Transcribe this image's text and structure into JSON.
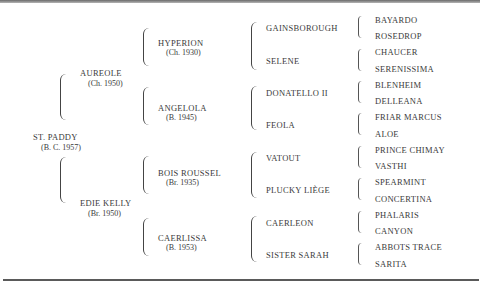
{
  "pedigree": {
    "subject": {
      "name": "ST. PADDY",
      "detail": "(B. C. 1957)"
    },
    "sire": {
      "name": "AUREOLE",
      "detail": "(Ch. 1950)"
    },
    "dam": {
      "name": "EDIE KELLY",
      "detail": "(Br. 1950)"
    },
    "gen2": [
      {
        "name": "HYPERION",
        "detail": "(Ch. 1930)"
      },
      {
        "name": "ANGELOLA",
        "detail": "(B. 1945)"
      },
      {
        "name": "BOIS ROUSSEL",
        "detail": "(Br. 1935)"
      },
      {
        "name": "CAERLISSA",
        "detail": "(B. 1953)"
      }
    ],
    "gen3": [
      {
        "name": "GAINSBOROUGH"
      },
      {
        "name": "SELENE"
      },
      {
        "name": "DONATELLO II"
      },
      {
        "name": "FEOLA"
      },
      {
        "name": "VATOUT"
      },
      {
        "name": "PLUCKY LIÈGE"
      },
      {
        "name": "CAERLEON"
      },
      {
        "name": "SISTER SARAH"
      }
    ],
    "gen4": [
      {
        "name": "BAYARDO"
      },
      {
        "name": "ROSEDROP"
      },
      {
        "name": "CHAUCER"
      },
      {
        "name": "SERENISSIMA"
      },
      {
        "name": "BLENHEIM"
      },
      {
        "name": "DELLEANA"
      },
      {
        "name": "FRIAR MARCUS"
      },
      {
        "name": "ALOE"
      },
      {
        "name": "PRINCE CHIMAY"
      },
      {
        "name": "VASTHI"
      },
      {
        "name": "SPEARMINT"
      },
      {
        "name": "CONCERTINA"
      },
      {
        "name": "PHALARIS"
      },
      {
        "name": "CANYON"
      },
      {
        "name": "ABBOTS TRACE"
      },
      {
        "name": "SARITA"
      }
    ]
  }
}
